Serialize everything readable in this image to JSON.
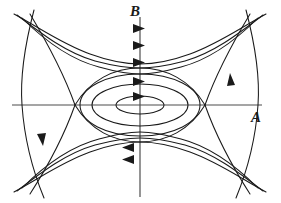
{
  "figure": {
    "kind": "phase-portrait",
    "width": 281,
    "height": 203,
    "background": "#ffffff",
    "stroke_color": "#1a1a1a",
    "axis_color": "#4d4d4d"
  },
  "axes": {
    "horizontal": {
      "label": "A",
      "label_x": 251,
      "label_y": 110,
      "y": 105,
      "x_start": 12,
      "x_end": 262
    },
    "vertical": {
      "label": "B",
      "label_x": 130,
      "label_y": 4,
      "x": 140,
      "y_start": 17,
      "y_end": 197
    }
  },
  "fixed_points": {
    "center": {
      "x": 140,
      "y": 105,
      "type": "center"
    },
    "saddle_left": {
      "x": 75,
      "y": 105,
      "type": "saddle"
    },
    "saddle_right": {
      "x": 205,
      "y": 105,
      "type": "saddle"
    }
  },
  "curves": {
    "closed_orbits": [
      {
        "rx": 24,
        "ry": 9
      },
      {
        "rx": 48,
        "ry": 21
      },
      {
        "rx": 62,
        "ry": 31
      }
    ],
    "inner_orbit_wide": "M 140 74 C 104 74 80 88 80 105 C 80 122 104 136 140 136 C 176 136 200 122 200 105 C 200 88 176 74 140 74 Z",
    "separatrix_upper": "M 75 105 C 92 82 116 70 140 70 C 164 70 188 82 205 105",
    "separatrix_lower": "M 75 105 C 92 128 116 140 140 140 C 164 140 188 128 205 105",
    "separatrix_outer_left_up": "M 75 105 C 62 72 46 44 28 20",
    "separatrix_outer_left_down": "M 75 105 C 62 138 46 166 28 190",
    "separatrix_outer_right_up": "M 205 105 C 218 72 234 44 252 20",
    "separatrix_outer_right_down": "M 205 105 C 218 138 234 166 252 190",
    "outer_upper_1": "M 14 14 C 40 28 62 44 90 54 C 112 62 126 64 140 64 C 154 64 168 62 190 54 C 218 44 240 28 266 14",
    "outer_upper_2": "M 16 14 C 42 34 66 52 94 60 C 114 66 127 68 140 68 C 153 68 166 66 186 60 C 214 52 238 34 264 14",
    "outer_upper_3": "M 20 16 C 46 42 70 58 98 66 C 116 71 128 73 140 73 C 152 73 164 71 182 66 C 210 58 234 42 260 16",
    "outer_lower_1": "M 14 192 C 40 178 62 162 90 152 C 112 144 126 142 140 142 C 154 142 168 144 190 152 C 218 162 240 178 266 192",
    "outer_lower_2": "M 16 192 C 42 172 66 154 94 146 C 114 140 127 138 140 138 C 153 138 166 140 186 146 C 214 154 238 172 264 192",
    "outer_lower_3": "M 20 190 C 46 164 70 148 98 140 C 116 135 128 133 140 133 C 152 133 164 135 182 140 C 210 148 234 164 260 190",
    "side_left_outer": "M 30 12 C 22 50 20 78 22 105 C 24 132 30 162 42 196",
    "side_right_outer": "M 250 12 C 258 50 260 78 258 105 C 256 132 250 162 238 196"
  },
  "arrows": {
    "on_vertical_axis_up": [
      {
        "x": 140,
        "y": 28,
        "dir": "right"
      },
      {
        "x": 140,
        "y": 45,
        "dir": "right"
      },
      {
        "x": 140,
        "y": 62,
        "dir": "right"
      },
      {
        "x": 140,
        "y": 81,
        "dir": "right"
      },
      {
        "x": 140,
        "y": 96,
        "dir": "right"
      }
    ],
    "on_vertical_axis_down": [
      {
        "x": 140,
        "y": 147,
        "dir": "left"
      },
      {
        "x": 140,
        "y": 159,
        "dir": "left"
      }
    ],
    "on_side_curves": [
      {
        "x": 42,
        "y": 140,
        "dir": "down"
      },
      {
        "x": 233,
        "y": 78,
        "dir": "up"
      }
    ],
    "flow_direction": "clockwise"
  }
}
